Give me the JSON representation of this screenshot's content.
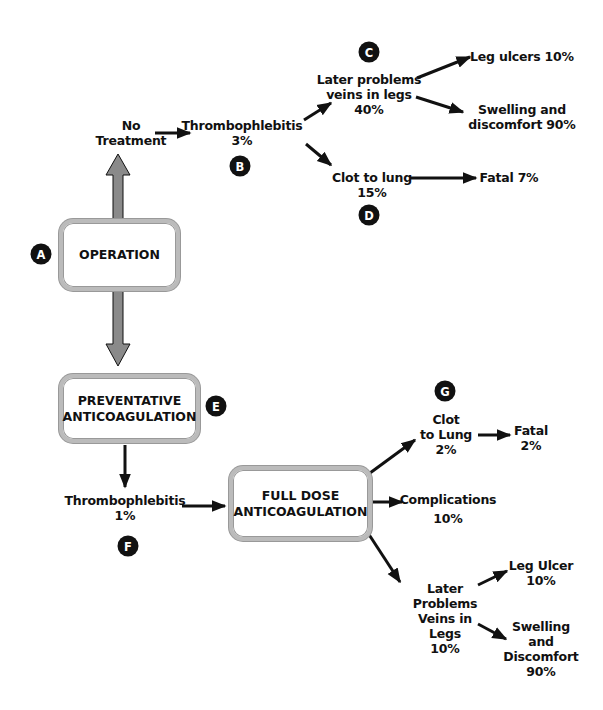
{
  "diagram": {
    "title": "",
    "nodes": {
      "no_treatment": [
        "No",
        "Treatment"
      ],
      "thrombo_3": [
        "Thrombophlebitis",
        "3%"
      ],
      "later_problems_40": [
        "Later problems",
        "veins in legs",
        "40%"
      ],
      "leg_ulcers_10": [
        "Leg ulcers 10%"
      ],
      "swelling_90": [
        "Swelling and",
        "discomfort 90%"
      ],
      "clot_lung_15": [
        "Clot to lung",
        "15%"
      ],
      "fatal_7": [
        "Fatal 7%"
      ],
      "operation": [
        "OPERATION"
      ],
      "preventative": [
        "PREVENTATIVE",
        "ANTICOAGULATION"
      ],
      "thrombo_1": [
        "Thrombophlebitis",
        "1%"
      ],
      "full_dose": [
        "FULL DOSE",
        "ANTICOAGULATION"
      ],
      "clot_lung_2": [
        "Clot",
        "to Lung",
        "2%"
      ],
      "fatal_2": [
        "Fatal",
        "2%"
      ],
      "complications": [
        "Complications",
        "10%"
      ],
      "later_problems_10": [
        "Later",
        "Problems",
        "Veins in",
        "Legs",
        "10%"
      ],
      "leg_ulcer_10": [
        "Leg Ulcer",
        "10%"
      ],
      "swelling_discomfort_90": [
        "Swelling",
        "and",
        "Discomfort",
        "90%"
      ]
    },
    "badges": {
      "a": "A",
      "b": "B",
      "c": "C",
      "d": "D",
      "e": "E",
      "f": "F",
      "g": "G"
    },
    "colors": {
      "arrow": "#111111",
      "thick_arrow_fill": "#8a8a8a",
      "box_border": "#b5b5b5",
      "badge_bg": "#111111"
    }
  }
}
